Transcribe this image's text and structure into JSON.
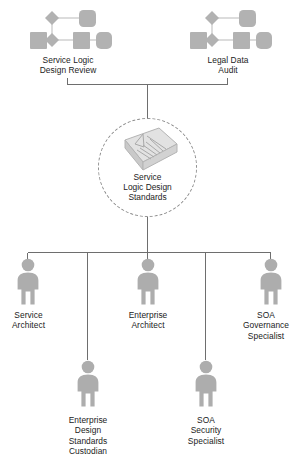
{
  "diagram": {
    "colors": {
      "figure_fill": "#adadad",
      "figure_shade": "#8f8f8f",
      "line": "#6e6e6e",
      "dashed_circle": "#8e8e8e",
      "text": "#1b1b1b",
      "background": "#ffffff"
    }
  },
  "processes": [
    {
      "id": "service-logic-design-review",
      "label": "Service Logic\nDesign Review",
      "icon": "process-cluster-icon"
    },
    {
      "id": "legal-data-audit",
      "label": "Legal Data\nAudit",
      "icon": "process-cluster-icon"
    }
  ],
  "center": {
    "id": "service-logic-design-standards",
    "label": "Service\nLogic Design\nStandards",
    "icon": "document-stack-icon",
    "container": "dashed-circle"
  },
  "roles": [
    {
      "id": "service-architect",
      "label": "Service\nArchitect",
      "icon": "person-icon",
      "row": "primary"
    },
    {
      "id": "enterprise-architect",
      "label": "Enterprise\nArchitect",
      "icon": "person-icon",
      "row": "primary"
    },
    {
      "id": "soa-governance-specialist",
      "label": "SOA\nGovernance\nSpecialist",
      "icon": "person-icon",
      "row": "primary"
    },
    {
      "id": "enterprise-design-standards-custodian",
      "label": "Enterprise\nDesign\nStandards\nCustodian",
      "icon": "person-icon",
      "row": "secondary"
    },
    {
      "id": "soa-security-specialist",
      "label": "SOA\nSecurity\nSpecialist",
      "icon": "person-icon",
      "row": "secondary"
    }
  ]
}
